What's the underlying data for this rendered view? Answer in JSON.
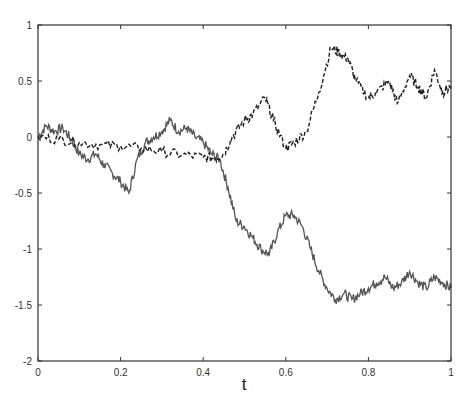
{
  "chart_data": {
    "type": "line",
    "title": "",
    "xlabel": "t",
    "ylabel": "",
    "xlim": [
      0,
      1
    ],
    "ylim": [
      -2,
      1
    ],
    "grid": false,
    "legend": null,
    "xticks": [
      "0",
      "0.2",
      "0.4",
      "0.6",
      "0.8",
      "1"
    ],
    "yticks": [
      "1",
      "0.5",
      "0",
      "-0.5",
      "-1",
      "-1.5",
      "-2"
    ],
    "series": [
      {
        "name": "solid path",
        "style": "solid",
        "color": "#555555",
        "x": [
          0,
          0.02,
          0.04,
          0.06,
          0.08,
          0.1,
          0.12,
          0.14,
          0.16,
          0.18,
          0.2,
          0.22,
          0.24,
          0.26,
          0.28,
          0.3,
          0.32,
          0.34,
          0.36,
          0.38,
          0.4,
          0.42,
          0.44,
          0.46,
          0.48,
          0.5,
          0.52,
          0.54,
          0.56,
          0.58,
          0.6,
          0.62,
          0.64,
          0.66,
          0.68,
          0.7,
          0.72,
          0.74,
          0.76,
          0.78,
          0.8,
          0.82,
          0.84,
          0.86,
          0.88,
          0.9,
          0.92,
          0.94,
          0.96,
          0.98,
          1.0
        ],
        "y": [
          0,
          0.1,
          0.05,
          0.08,
          -0.02,
          -0.15,
          -0.2,
          -0.15,
          -0.25,
          -0.32,
          -0.4,
          -0.5,
          -0.2,
          -0.05,
          0.0,
          0.05,
          0.15,
          0.05,
          0.08,
          0.0,
          -0.05,
          -0.15,
          -0.2,
          -0.45,
          -0.75,
          -0.8,
          -0.9,
          -1.0,
          -1.05,
          -0.85,
          -0.7,
          -0.7,
          -0.8,
          -1.0,
          -1.2,
          -1.35,
          -1.45,
          -1.4,
          -1.45,
          -1.4,
          -1.35,
          -1.3,
          -1.25,
          -1.35,
          -1.3,
          -1.2,
          -1.3,
          -1.35,
          -1.25,
          -1.3,
          -1.35
        ]
      },
      {
        "name": "dashed path",
        "style": "dashed",
        "color": "#222222",
        "x": [
          0,
          0.05,
          0.1,
          0.15,
          0.2,
          0.25,
          0.3,
          0.35,
          0.4,
          0.43,
          0.45,
          0.47,
          0.5,
          0.52,
          0.55,
          0.57,
          0.6,
          0.62,
          0.65,
          0.68,
          0.71,
          0.73,
          0.75,
          0.77,
          0.8,
          0.82,
          0.85,
          0.87,
          0.9,
          0.92,
          0.94,
          0.96,
          0.98,
          1.0
        ],
        "y": [
          0,
          -0.02,
          -0.05,
          -0.07,
          -0.08,
          -0.1,
          -0.13,
          -0.16,
          -0.18,
          -0.19,
          -0.15,
          0.0,
          0.15,
          0.2,
          0.35,
          0.15,
          -0.1,
          -0.05,
          0.05,
          0.4,
          0.8,
          0.75,
          0.7,
          0.5,
          0.35,
          0.4,
          0.5,
          0.3,
          0.55,
          0.45,
          0.35,
          0.6,
          0.4,
          0.45
        ]
      }
    ]
  }
}
